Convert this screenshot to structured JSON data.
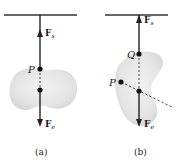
{
  "figure": {
    "panel_a": {
      "caption": "(a)",
      "point_label": "P",
      "force_up": {
        "symbol": "F",
        "subscript": "s"
      },
      "force_down": {
        "symbol": "F",
        "subscript": "e"
      }
    },
    "panel_b": {
      "caption": "(b)",
      "point_labels": {
        "top": "Q",
        "side": "P"
      },
      "force_up": {
        "symbol": "F",
        "subscript": "s"
      },
      "force_down": {
        "symbol": "F",
        "subscript": "e"
      }
    },
    "colors": {
      "body_fill": "#e6e6e6",
      "line": "#222222",
      "ceiling": "#333333"
    }
  }
}
